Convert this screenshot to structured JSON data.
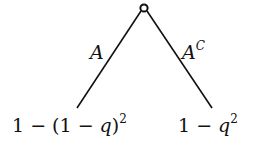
{
  "diagram": {
    "type": "probability-tree",
    "root": {
      "shape": "open-circle"
    },
    "edges": [
      {
        "label_base": "A",
        "label_sup": ""
      },
      {
        "label_base": "A",
        "label_sup": "C"
      }
    ],
    "leaves": [
      {
        "prefix": "1 − (1 − ",
        "var": "q",
        "suffix": ")",
        "exp": "2"
      },
      {
        "prefix": "1 − ",
        "var": "q",
        "suffix": "",
        "exp": "2"
      }
    ]
  }
}
